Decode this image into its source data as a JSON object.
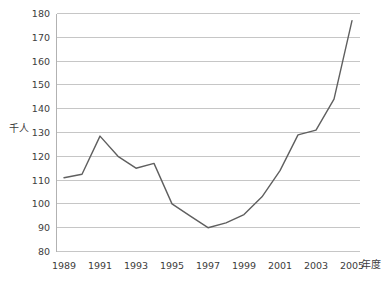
{
  "chart_data": {
    "type": "line",
    "title": "",
    "ylabel": "千人",
    "xlabel": "年度",
    "x": [
      1989,
      1990,
      1991,
      1992,
      1993,
      1994,
      1995,
      1996,
      1997,
      1998,
      1999,
      2000,
      2001,
      2002,
      2003,
      2004,
      2005
    ],
    "values": [
      111,
      112.5,
      128.5,
      120,
      115,
      117,
      100,
      95,
      90,
      92,
      95.5,
      103,
      114,
      129,
      131,
      144,
      177
    ],
    "ylim": [
      80,
      180
    ],
    "ytick_step": 10,
    "ytick_labels": [
      "180",
      "170",
      "160",
      "150",
      "140",
      "130",
      "120",
      "110",
      "100",
      "90",
      "80"
    ],
    "xtick_labels": [
      "1989",
      "1991",
      "1993",
      "1995",
      "1997",
      "1999",
      "2001",
      "2003",
      "2005"
    ],
    "grid": true,
    "legend_position": "none",
    "colors": {
      "line": "#5f5f5f",
      "grid": "#c6c6c6",
      "axis": "#b2b2b2",
      "text": "#3d3d3d",
      "background": "#ffffff"
    }
  }
}
